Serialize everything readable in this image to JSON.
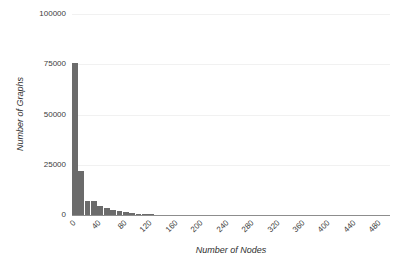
{
  "chart_data": {
    "type": "bar",
    "title": "",
    "subtitle": "",
    "xlabel": "Number of Nodes",
    "ylabel": "Number of Graphs",
    "xlim": [
      0,
      500
    ],
    "ylim": [
      0,
      100000
    ],
    "grid": true,
    "legend": null,
    "legend_position": "none",
    "annotations": [],
    "bar_color": "#6b6b6b",
    "bin_width": 10,
    "x_tick_labels": [
      "0",
      "40",
      "80",
      "120",
      "160",
      "200",
      "240",
      "280",
      "320",
      "360",
      "400",
      "440",
      "480"
    ],
    "x_tick_values": [
      0,
      40,
      80,
      120,
      160,
      200,
      240,
      280,
      320,
      360,
      400,
      440,
      480
    ],
    "y_tick_labels": [
      "0",
      "25000",
      "50000",
      "75000",
      "100000"
    ],
    "y_tick_values": [
      0,
      25000,
      50000,
      75000,
      100000
    ],
    "bin_centers": [
      5,
      15,
      25,
      35,
      45,
      55,
      65,
      75,
      85,
      95,
      105,
      115,
      125,
      135,
      145,
      155,
      165,
      175,
      185,
      195
    ],
    "values": [
      75500,
      22000,
      7200,
      7000,
      4300,
      3500,
      2600,
      2100,
      1500,
      1200,
      700,
      500,
      320,
      200,
      140,
      90,
      60,
      40,
      25,
      15
    ]
  },
  "axes": {
    "y_title": "Number of Graphs",
    "x_title": "Number of Nodes"
  }
}
